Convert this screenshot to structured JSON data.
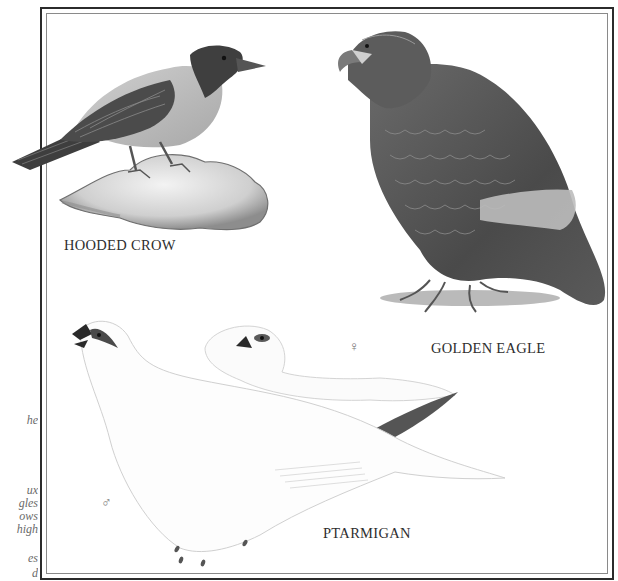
{
  "plate": {
    "labels": {
      "hooded_crow": "HOODED CROW",
      "golden_eagle": "GOLDEN EAGLE",
      "ptarmigan": "PTARMIGAN"
    },
    "sex_symbols": {
      "female": "♀",
      "male": "♂"
    }
  },
  "margin_text_fragments": [
    "he",
    "",
    "ux",
    "gles",
    "ows",
    "high",
    "",
    "es",
    "d"
  ],
  "colors": {
    "frame_outer": "#2b2b2b",
    "frame_inner": "#8a8a8a",
    "background": "#ffffff"
  }
}
